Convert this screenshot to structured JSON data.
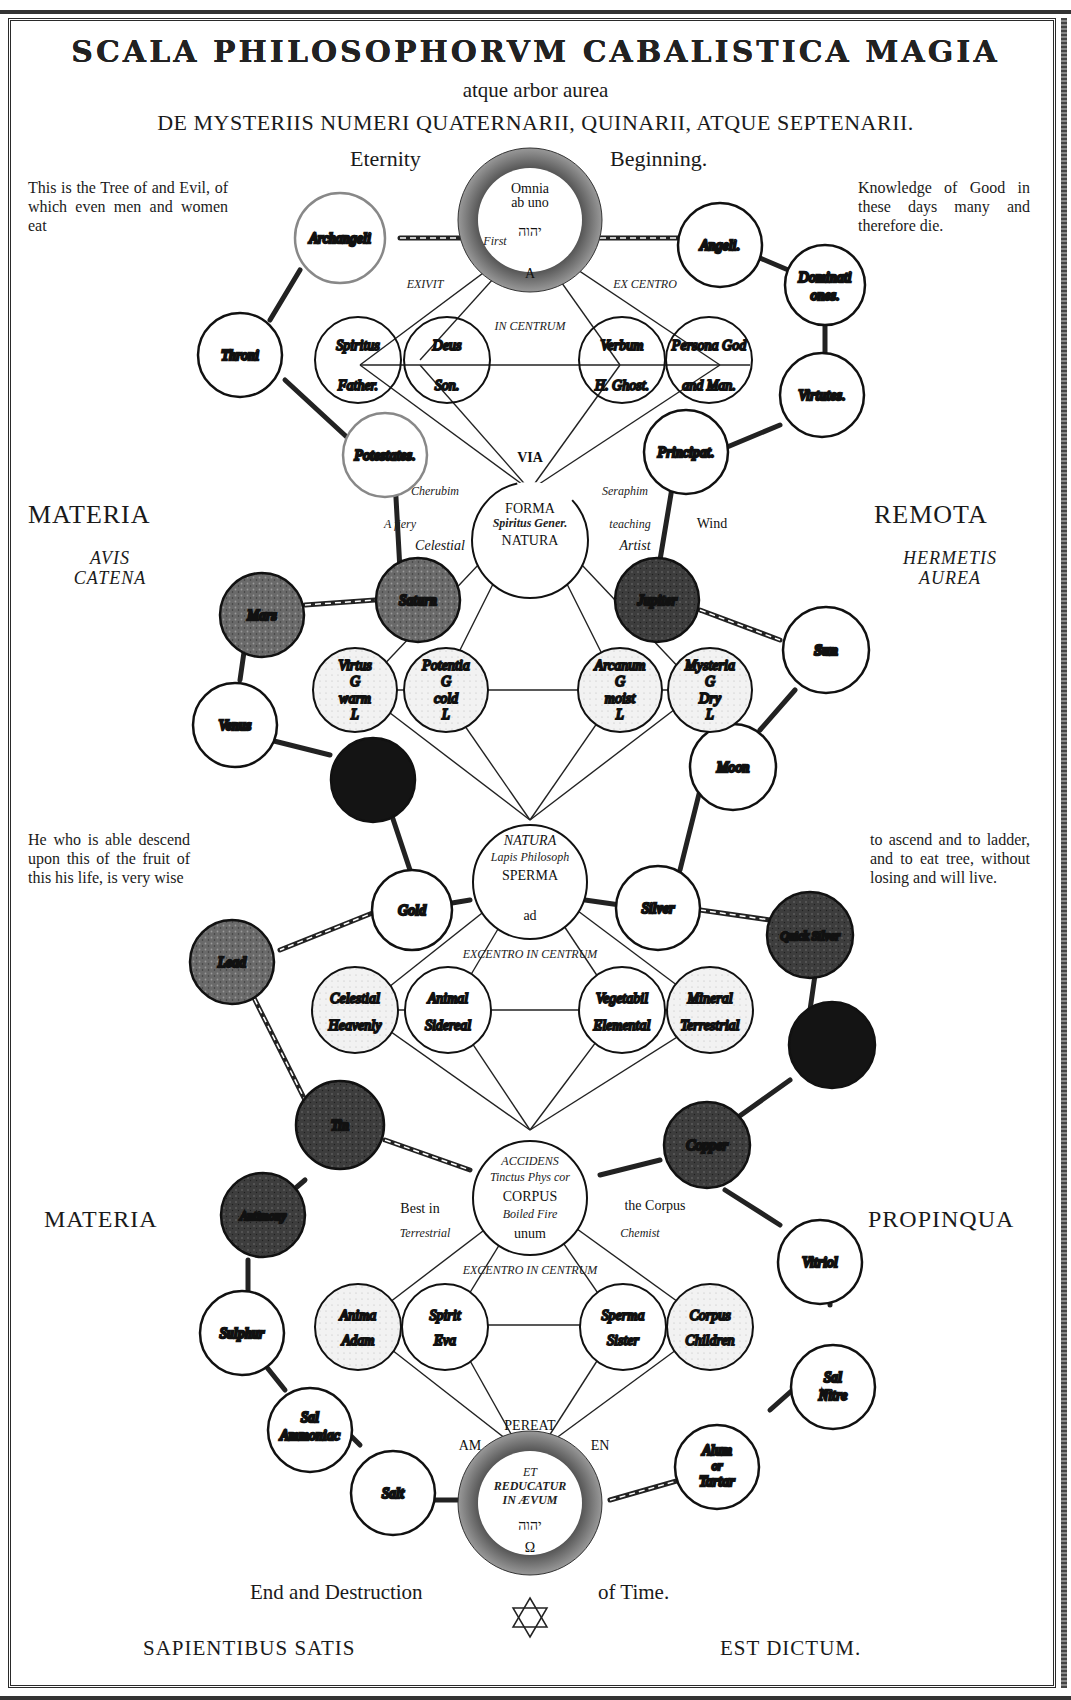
{
  "header": {
    "title": "SCALA PHILOSOPHORVM CABALISTICA MAGIA",
    "subtitle": "atque arbor aurea",
    "line3": "DE MYSTERIIS NUMERI QUATERNARII, QUINARII, ATQUE SEPTENARII.",
    "eternity_left": "Eternity",
    "eternity_right": "Beginning."
  },
  "paragraphs": {
    "top_left": "This is the Tree of and Evil, of which even men and women eat",
    "top_right": "Knowledge of Good in these days many and therefore die.",
    "mid_left": "He who is able descend upon this of the fruit of this his life, is very wise",
    "mid_right": "to ascend and to ladder, and to eat tree, without losing and will live."
  },
  "side_labels": {
    "materia_top": "MATERIA",
    "avis": "AVIS",
    "catena": "CATENA",
    "remota": "REMOTA",
    "hermetis": "HERMETIS",
    "aurea": "AUREA",
    "materia_bottom": "MATERIA",
    "propinqua": "PROPINQUA"
  },
  "footer": {
    "end_left": "End and Destruction",
    "end_right": "of Time.",
    "motto_left": "SAPIENTIBUS SATIS",
    "motto_right": "EST DICTUM."
  },
  "colors": {
    "ink": "#111111",
    "paper": "#ffffff",
    "shade_light": "#d9d9d9",
    "shade_mid": "#777777",
    "shade_dark": "#444444",
    "shade_black": "#141414"
  },
  "diagram": {
    "top_sun": {
      "line1": "Omnia",
      "line2": "ab uno",
      "hebrew": "יהוה",
      "first": "First",
      "alpha": "A"
    },
    "labels": {
      "exivit": "EXIVIT",
      "ex_centro": "EX CENTRO",
      "in_centrum": "IN CENTRUM",
      "via": "VIA",
      "cherubim": "Cherubim",
      "seraphim": "Seraphim",
      "a_fiery": "A fiery",
      "celestial": "Celestial",
      "teaching": "teaching",
      "artist": "Artist",
      "wind": "Wind",
      "excentro_in_centrum_1": "EXCENTRO IN CENTRUM",
      "excentro_in_centrum_2": "EXCENTRO IN CENTRUM",
      "best_in": "Best in",
      "terrestrial": "Terrestrial",
      "the_corpus": "the Corpus",
      "chemist": "Chemist",
      "pereat": "PEREAT",
      "am": "AM",
      "en": "EN"
    },
    "centers": [
      {
        "id": "forma",
        "l1": "FORMA",
        "l2": "Spiritus Gener.",
        "l3": "NATURA"
      },
      {
        "id": "natura",
        "l1": "NATURA",
        "l2": "Lapis Philosoph",
        "l3": "SPERMA",
        "l4": "ad"
      },
      {
        "id": "corpus",
        "l1": "ACCIDENS",
        "l2": "Tinctus Phys cor",
        "l3": "CORPUS",
        "l4": "Boiled Fire",
        "l5": "unum"
      }
    ],
    "bottom_sun": {
      "et": "ET",
      "reducatur": "REDUCATUR",
      "in_aevum": "IN ÆVUM",
      "hebrew": "יהוה",
      "omega": "Ω"
    },
    "row1": [
      {
        "top": "Spiritus",
        "bottom": "Father."
      },
      {
        "top": "Deus",
        "bottom": "Son."
      },
      {
        "top": "Verbum",
        "bottom": "H. Ghost."
      },
      {
        "top": "Persona God",
        "bottom": "and Man."
      }
    ],
    "row2": [
      {
        "top": "Virtus",
        "mid": "G",
        "low": "warm",
        "bot": "L"
      },
      {
        "top": "Potentia",
        "mid": "G",
        "low": "cold",
        "bot": "L"
      },
      {
        "top": "Arcanum",
        "mid": "G",
        "low": "moist",
        "bot": "L"
      },
      {
        "top": "Mysteria",
        "mid": "G",
        "low": "Dry",
        "bot": "L"
      }
    ],
    "row3": [
      {
        "top": "Celestial",
        "bottom": "Heavenly"
      },
      {
        "top": "Animal",
        "bottom": "Sidereal"
      },
      {
        "top": "Vegetabil",
        "bottom": "Elemental"
      },
      {
        "top": "Mineral",
        "bottom": "Terrestrial"
      }
    ],
    "row4": [
      {
        "top": "Anima",
        "bottom": "Adam"
      },
      {
        "top": "Spirit",
        "bottom": "Eva"
      },
      {
        "top": "Sperma",
        "bottom": "Sister"
      },
      {
        "top": "Corpus",
        "bottom": "Children"
      }
    ],
    "chain": {
      "archangeli": "Archangeli",
      "angeli": "Angeli.",
      "throni": "Throni",
      "dominationes_1": "Dominati",
      "dominationes_2": "ones.",
      "potestates": "Potestates.",
      "virtutes": "Virtutes.",
      "principat": "Principat.",
      "saturn": "Saturn",
      "mars": "Mars",
      "jupiter": "Jupiter",
      "sun": "Sun",
      "venus": "Venus",
      "moon": "Moon",
      "gold": "Gold",
      "silver": "Silver",
      "lead": "Lead",
      "quicksilver": "Quick Silver",
      "tin": "Tin",
      "copper": "Copper",
      "antimony": "Antimony",
      "vitriol": "Vitriol",
      "sulphur": "Sulphur",
      "sal_nitre_1": "Sal",
      "sal_nitre_2": "Nitre",
      "sal_ammoniac_1": "Sal",
      "sal_ammoniac_2": "Ammoniac",
      "salt": "Salt",
      "alum_1": "Alum",
      "alum_2": "or",
      "alum_3": "Tartar"
    }
  }
}
